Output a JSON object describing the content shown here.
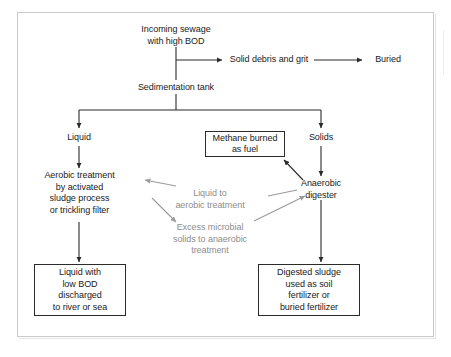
{
  "diagram": {
    "frame_color": "#c9c9c9",
    "text_color": "#1a1a1a",
    "recycle_label_color": "#8d8d8d",
    "nodes": {
      "incoming_sewage": "Incoming sewage\nwith high BOD",
      "solid_debris": "Solid debris and grit",
      "buried": "Buried",
      "sedimentation_tank": "Sedimentation tank",
      "liquid": "Liquid",
      "solids": "Solids",
      "methane": "Methane burned\nas fuel",
      "aerobic": "Aerobic treatment\nby activated\nsludge process\nor trickling filter",
      "anaerobic": "Anaerobic\ndigester",
      "recycle_liquid": "Liquid to\naerobic treatment",
      "recycle_solids": "Excess microbial\nsolids to anaerobic\ntreatment",
      "effluent": "Liquid with\nlow BOD\ndischarged\nto river or sea",
      "sludge": "Digested sludge\nused as soil\nfertilizer or\nburied fertilizer"
    }
  }
}
